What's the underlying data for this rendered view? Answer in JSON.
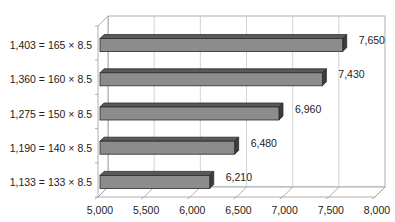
{
  "chart_data": {
    "type": "bar",
    "orientation": "horizontal",
    "style": "3d",
    "title": "",
    "xlabel": "",
    "ylabel": "",
    "categories": [
      "1,403 = 165 × 8.5",
      "1,360 = 160 × 8.5",
      "1,275 = 150 × 8.5",
      "1,190 = 140 × 8.5",
      "1,133 = 133 × 8.5"
    ],
    "values": [
      7650,
      7430,
      6960,
      6480,
      6210
    ],
    "value_labels": [
      "7,650",
      "7,430",
      "6,960",
      "6,480",
      "6,210"
    ],
    "xlim": [
      5000,
      8000
    ],
    "x_ticks": [
      5000,
      5500,
      6000,
      6500,
      7000,
      7500,
      8000
    ],
    "x_tick_labels": [
      "5,000",
      "5,500",
      "6,000",
      "6,500",
      "7,000",
      "7,500",
      "8,000"
    ],
    "grid": true,
    "legend": null,
    "colors": {
      "bar_front": "#8c8c8c",
      "bar_top": "#5a5a5a",
      "bar_side": "#3c3c3c",
      "bar_outline": "#2a2a2a",
      "grid": "#c8c8c8",
      "axis": "#9a9a9a"
    }
  }
}
